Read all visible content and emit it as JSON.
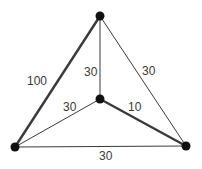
{
  "diagram": {
    "type": "weighted-graph",
    "colors": {
      "background": "#ffffff",
      "edge": "#3a3a3a",
      "node": "#111111",
      "label": "#3a3a3a"
    },
    "nodes": [
      {
        "id": "top",
        "x": 100,
        "y": 16
      },
      {
        "id": "center",
        "x": 100,
        "y": 99
      },
      {
        "id": "left",
        "x": 15,
        "y": 147
      },
      {
        "id": "right",
        "x": 186,
        "y": 146
      }
    ],
    "edges": [
      {
        "from": "top",
        "to": "left",
        "weight": "100",
        "thick": true,
        "label_x": 27,
        "label_y": 75
      },
      {
        "from": "top",
        "to": "center",
        "weight": "30",
        "thick": false,
        "label_x": 84,
        "label_y": 66
      },
      {
        "from": "top",
        "to": "right",
        "weight": "30",
        "thick": false,
        "label_x": 142,
        "label_y": 65
      },
      {
        "from": "center",
        "to": "left",
        "weight": "30",
        "thick": false,
        "label_x": 63,
        "label_y": 101
      },
      {
        "from": "center",
        "to": "right",
        "weight": "10",
        "thick": true,
        "label_x": 128,
        "label_y": 101
      },
      {
        "from": "left",
        "to": "right",
        "weight": "30",
        "thick": false,
        "label_x": 99,
        "label_y": 150
      }
    ]
  }
}
